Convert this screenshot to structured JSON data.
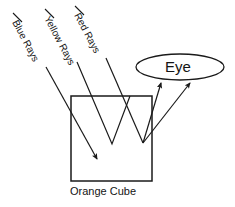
{
  "diagram": {
    "title_alt": "Orange cube reflecting red rays toward an eye",
    "labels": {
      "blue_rays": "Blue Rays",
      "yellow_rays": "Yellow Rays",
      "red_rays": "Red Rays",
      "eye": "Eye",
      "orange_cube": "Orange Cube"
    },
    "colors": {
      "stroke": "#1a1a1a",
      "background": "#ffffff",
      "text": "#141414"
    },
    "shapes": {
      "cube": {
        "x": 71,
        "y": 96,
        "width": 81,
        "height": 85,
        "fill": "none"
      },
      "eye_ellipse": {
        "cx": 180,
        "cy": 67,
        "rx": 44,
        "ry": 13
      }
    },
    "rays": [
      {
        "name": "blue-ray",
        "label": "Blue Rays",
        "behavior": "absorbed",
        "points": [
          [
            46,
            67
          ],
          [
            97,
            159
          ]
        ],
        "arrowhead": true
      },
      {
        "name": "yellow-ray",
        "label": "Yellow Rays",
        "behavior": "absorbed",
        "points": [
          [
            77,
            62
          ],
          [
            112,
            144
          ],
          [
            130,
            96
          ]
        ],
        "arrowhead": false
      },
      {
        "name": "red-ray-1",
        "label": "Red Rays",
        "behavior": "reflected-to-eye",
        "points": [
          [
            106,
            58
          ],
          [
            143,
            143
          ],
          [
            160,
            83
          ]
        ],
        "arrowhead": true
      },
      {
        "name": "red-ray-2",
        "label": "Red Rays",
        "behavior": "reflected-to-eye",
        "points": [
          [
            143,
            143
          ],
          [
            190,
            83
          ]
        ],
        "arrowhead": true
      }
    ],
    "leader_dashes": [
      {
        "name": "blue-leader",
        "points": [
          [
            13,
            13
          ],
          [
            22,
            22
          ]
        ]
      },
      {
        "name": "yellow-leader",
        "points": [
          [
            45,
            9
          ],
          [
            54,
            18
          ]
        ]
      },
      {
        "name": "red-leader",
        "points": [
          [
            75,
            6
          ],
          [
            84,
            15
          ]
        ]
      }
    ]
  }
}
